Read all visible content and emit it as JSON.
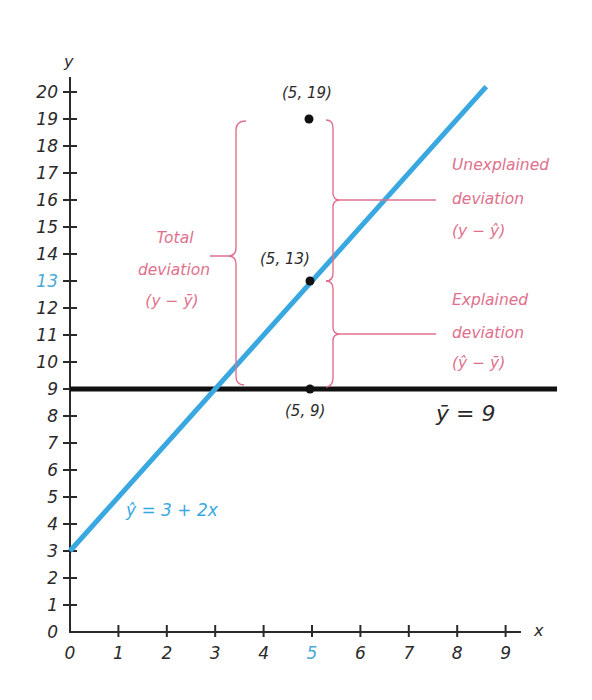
{
  "chart_data": {
    "type": "line",
    "title": "",
    "xlabel": "x",
    "ylabel": "y",
    "xlim": [
      0,
      9.6
    ],
    "ylim": [
      0,
      20.5
    ],
    "grid": false,
    "x_ticks": [
      "0",
      "1",
      "2",
      "3",
      "4",
      "5",
      "6",
      "7",
      "8",
      "9"
    ],
    "y_ticks": [
      "0",
      "1",
      "2",
      "3",
      "4",
      "5",
      "6",
      "7",
      "8",
      "9",
      "10",
      "11",
      "12",
      "13",
      "14",
      "15",
      "16",
      "17",
      "18",
      "19",
      "20"
    ],
    "highlighted_ticks": {
      "x": "5",
      "y": "13"
    },
    "series": [
      {
        "name": "regression line",
        "equation": "ŷ = 3 + 2x",
        "intercept": 3,
        "slope": 2,
        "x_range": [
          0,
          8.6
        ],
        "color": "#3aa8e0"
      },
      {
        "name": "mean line",
        "equation": "ȳ = 9",
        "value": 9,
        "x_range": [
          0,
          9.9
        ],
        "color": "#111111"
      }
    ],
    "points": [
      {
        "x": 5,
        "y": 19,
        "label": "(5, 19)"
      },
      {
        "x": 5,
        "y": 13,
        "label": "(5, 13)"
      },
      {
        "x": 5,
        "y": 9,
        "label": "(5, 9)"
      }
    ],
    "annotations": [
      {
        "name": "total-deviation",
        "lines": [
          "Total",
          "deviation",
          "(y − ȳ)"
        ],
        "from": 9,
        "to": 19,
        "color": "#e0708c"
      },
      {
        "name": "unexplained-deviation",
        "lines": [
          "Unexplained",
          "deviation",
          "(y − ŷ)"
        ],
        "from": 13,
        "to": 19,
        "color": "#e0708c"
      },
      {
        "name": "explained-deviation",
        "lines": [
          "Explained",
          "deviation",
          "(ŷ − ȳ)"
        ],
        "from": 9,
        "to": 13,
        "color": "#e0708c"
      }
    ]
  },
  "labels": {
    "x_axis": "x",
    "y_axis": "y",
    "regression_eq": "ŷ = 3 + 2x",
    "mean_eq": "ȳ = 9",
    "pt_19": "(5, 19)",
    "pt_13": "(5, 13)",
    "pt_9": "(5, 9)",
    "total": [
      "Total",
      "deviation",
      "(y − ȳ)"
    ],
    "unexplained": [
      "Unexplained",
      "deviation",
      "(y − ŷ)"
    ],
    "explained": [
      "Explained",
      "deviation",
      "(ŷ − ȳ)"
    ]
  },
  "colors": {
    "regression": "#3aa8e0",
    "mean": "#111111",
    "deviation": "#e0708c",
    "highlight_tick": "#4aa9d8"
  }
}
